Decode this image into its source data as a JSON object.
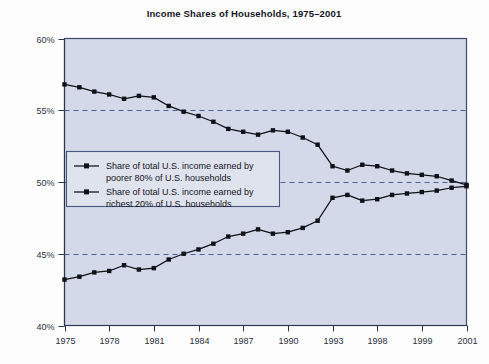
{
  "figure": {
    "width": 489,
    "height": 364,
    "background": "#fdfdfd",
    "plot_background": "#d3d9e8",
    "plot_border_color": "#3d4a6b",
    "grid_color": "#4f5f9a",
    "series_color": "#101018"
  },
  "chart_data": {
    "type": "line",
    "title": "Income Shares of Households, 1975–2001",
    "xlabel": "",
    "ylabel": "",
    "ylim": [
      40,
      60
    ],
    "ytick_values": [
      40,
      45,
      50,
      55,
      60
    ],
    "ytick_labels": [
      "40%",
      "45%",
      "50%",
      "55%",
      "60%"
    ],
    "grid": "horizontal-dashed-at-45-50-55",
    "legend_position": "inside-left-middle",
    "xtick_labels": [
      "1975",
      "1978",
      "1981",
      "1984",
      "1987",
      "1990",
      "1993",
      "1998",
      "1999",
      "2001"
    ],
    "xtick_positions": [
      0,
      3,
      6,
      9,
      12,
      15,
      18,
      21,
      24,
      27
    ],
    "x": [
      0,
      1,
      2,
      3,
      4,
      5,
      6,
      7,
      8,
      9,
      10,
      11,
      12,
      13,
      14,
      15,
      16,
      17,
      18,
      19,
      20,
      21,
      22,
      23,
      24,
      25,
      26,
      27
    ],
    "series": [
      {
        "name": "Share of total U.S. income earned by poorer 80% of U.S. households",
        "key": "poorer-80",
        "values": [
          56.8,
          56.6,
          56.3,
          56.1,
          55.8,
          56.0,
          55.9,
          55.3,
          54.9,
          54.6,
          54.2,
          53.7,
          53.5,
          53.3,
          53.6,
          53.5,
          53.1,
          52.6,
          51.1,
          50.8,
          51.2,
          51.1,
          50.8,
          50.6,
          50.5,
          50.4,
          50.1,
          49.8
        ]
      },
      {
        "name": "Share of total U.S. income earned by richest 20% of U.S. households",
        "key": "richest-20",
        "values": [
          43.2,
          43.4,
          43.7,
          43.8,
          44.2,
          43.9,
          44.0,
          44.6,
          45.0,
          45.3,
          45.7,
          46.2,
          46.4,
          46.7,
          46.4,
          46.5,
          46.8,
          47.3,
          48.9,
          49.1,
          48.7,
          48.8,
          49.1,
          49.2,
          49.3,
          49.4,
          49.6,
          49.7
        ]
      }
    ],
    "legend_entries": [
      {
        "line1": "Share of total U.S. income earned by",
        "line2": "poorer 80% of U.S. households"
      },
      {
        "line1": "Share of total U.S. income earned by",
        "line2": "richest 20% of U.S. households"
      }
    ]
  }
}
